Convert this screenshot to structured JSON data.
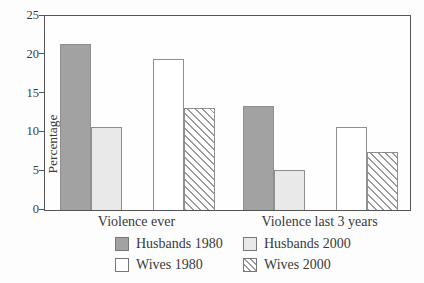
{
  "chart_data": {
    "type": "bar",
    "title": "",
    "ylabel": "Percentage",
    "xlabel": "",
    "ylim": [
      0,
      25
    ],
    "yticks": [
      0,
      5,
      10,
      15,
      20,
      25
    ],
    "categories": [
      "Violence ever",
      "Violence last 3 years"
    ],
    "series": [
      {
        "name": "Husbands 1980",
        "values": [
          21.4,
          13.4
        ],
        "fill": "#a2a2a2",
        "pattern": "solid"
      },
      {
        "name": "Husbands 2000",
        "values": [
          10.7,
          5.2
        ],
        "fill": "#e9e9e9",
        "pattern": "solid"
      },
      {
        "name": "Wives 1980",
        "values": [
          19.5,
          10.7
        ],
        "fill": "#ffffff",
        "pattern": "solid"
      },
      {
        "name": "Wives 2000",
        "values": [
          13.2,
          7.5
        ],
        "fill": "#ffffff",
        "pattern": "diagonal-hatch"
      }
    ],
    "legend_position": "bottom",
    "grid": false,
    "colors": {
      "axis": "#555555",
      "bar_border": "#8f8f8f",
      "hatch_line": "#9a9a9a",
      "text": "#3a3a3a"
    }
  }
}
